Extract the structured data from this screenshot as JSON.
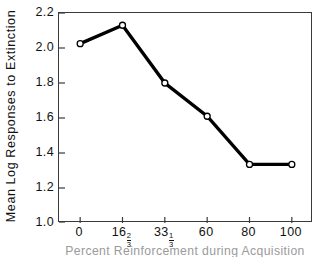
{
  "chart_data": {
    "type": "line",
    "title": "",
    "xlabel": "Percent Reinforcement during Acquisition",
    "ylabel": "Mean Log Responses to Extinction",
    "categories": [
      "0",
      "16 2/3",
      "33 1/3",
      "60",
      "80",
      "100"
    ],
    "category_labels": [
      {
        "whole": "0",
        "num": "",
        "den": ""
      },
      {
        "whole": "16",
        "num": "2",
        "den": "3"
      },
      {
        "whole": "33",
        "num": "1",
        "den": "3"
      },
      {
        "whole": "60",
        "num": "",
        "den": ""
      },
      {
        "whole": "80",
        "num": "",
        "den": ""
      },
      {
        "whole": "100",
        "num": "",
        "den": ""
      }
    ],
    "values": [
      2.025,
      2.13,
      1.8,
      1.61,
      1.335,
      1.335
    ],
    "ylim": [
      1.0,
      2.2
    ],
    "yticks": [
      "1.0",
      "1.2",
      "1.4",
      "1.6",
      "1.8",
      "2.0",
      "2.2"
    ],
    "ytick_values": [
      1.0,
      1.2,
      1.4,
      1.6,
      1.8,
      2.0,
      2.2
    ],
    "grid": false,
    "legend": "none",
    "line_color": "#000000",
    "marker_fill": "#ffffff",
    "marker_edge": "#000000",
    "axis_color": "#3a3a3a"
  }
}
